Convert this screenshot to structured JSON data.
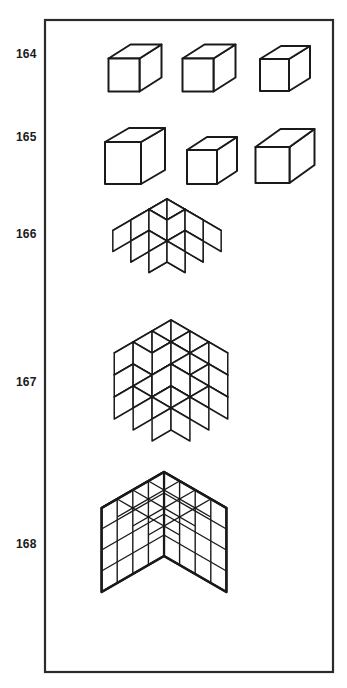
{
  "plate": {
    "title": "Cube figures plate",
    "background_color": "#ffffff",
    "ink_color": "#1a1a1a",
    "frame": {
      "name": "plate-border",
      "x": 45,
      "y": 20,
      "width": 288,
      "height": 652,
      "stroke_width": 2.2,
      "stroke_color": "#2b2b2b"
    },
    "rows": [
      {
        "label": "164",
        "description": "Three identical isometric cubes in a row",
        "figure_count": 3
      },
      {
        "label": "165",
        "description": "Three cubes of differing proportion and viewing angle",
        "figure_count": 3
      },
      {
        "label": "166",
        "description": "Three-dimensional cross arrangement of unit cubes",
        "figure_count": 1
      },
      {
        "label": "167",
        "description": "Dense stacked cube cluster with gaps",
        "figure_count": 1
      },
      {
        "label": "168",
        "description": "Solid 4 by 4 by 4 cube block",
        "figure_count": 1
      }
    ]
  },
  "chart_data": {
    "type": "diagram",
    "figures": [
      {
        "id": "164",
        "kind": "single-cubes",
        "count": 3,
        "cubes": [
          {
            "cx": 135,
            "cy": 75,
            "w": 31,
            "h": 33,
            "dx": 22,
            "dy": -14
          },
          {
            "cx": 209,
            "cy": 75,
            "w": 31,
            "h": 33,
            "dx": 22,
            "dy": -14
          },
          {
            "cx": 285,
            "cy": 75,
            "w": 29,
            "h": 32,
            "dx": 21,
            "dy": -13
          }
        ]
      },
      {
        "id": "165",
        "kind": "single-cubes",
        "count": 3,
        "cubes": [
          {
            "cx": 135,
            "cy": 163,
            "w": 36,
            "h": 42,
            "dx": 24,
            "dy": -14
          },
          {
            "cx": 212,
            "cy": 167,
            "w": 30,
            "h": 34,
            "dx": 20,
            "dy": -13
          },
          {
            "cx": 285,
            "cy": 165,
            "w": 34,
            "h": 36,
            "dx": 25,
            "dy": -18
          }
        ]
      },
      {
        "id": "166",
        "kind": "cube-cluster",
        "pattern": "3d-cross",
        "unit": 21,
        "origin_x": 167,
        "origin_y": 241,
        "cells": [
          [
            1,
            1,
            0
          ],
          [
            1,
            1,
            1
          ],
          [
            1,
            1,
            2
          ],
          [
            1,
            0,
            1
          ],
          [
            1,
            2,
            1
          ],
          [
            0,
            1,
            1
          ],
          [
            2,
            1,
            1
          ],
          [
            1,
            1,
            1
          ],
          [
            0,
            0,
            1
          ],
          [
            2,
            2,
            1
          ],
          [
            0,
            2,
            1
          ],
          [
            2,
            0,
            1
          ],
          [
            1,
            0,
            0
          ],
          [
            0,
            1,
            0
          ],
          [
            1,
            2,
            2
          ],
          [
            2,
            1,
            2
          ]
        ]
      },
      {
        "id": "167",
        "kind": "cube-cluster",
        "pattern": "dense-stack",
        "unit": 22,
        "origin_x": 171,
        "origin_y": 386,
        "cells": [
          [
            0,
            0,
            2
          ],
          [
            1,
            0,
            2
          ],
          [
            2,
            0,
            2
          ],
          [
            0,
            1,
            2
          ],
          [
            1,
            1,
            2
          ],
          [
            2,
            1,
            2
          ],
          [
            0,
            2,
            2
          ],
          [
            2,
            2,
            2
          ],
          [
            0,
            0,
            1
          ],
          [
            2,
            0,
            1
          ],
          [
            0,
            2,
            1
          ],
          [
            2,
            2,
            1
          ],
          [
            1,
            1,
            1
          ],
          [
            0,
            0,
            0
          ],
          [
            1,
            0,
            0
          ],
          [
            2,
            0,
            0
          ],
          [
            0,
            1,
            0
          ],
          [
            1,
            1,
            0
          ],
          [
            2,
            1,
            0
          ],
          [
            0,
            2,
            0
          ],
          [
            1,
            2,
            0
          ],
          [
            2,
            2,
            0
          ]
        ]
      },
      {
        "id": "168",
        "kind": "solid-block",
        "dimensions": [
          4,
          4,
          4
        ],
        "unit": 20,
        "origin_x": 164,
        "origin_y": 556
      }
    ]
  }
}
